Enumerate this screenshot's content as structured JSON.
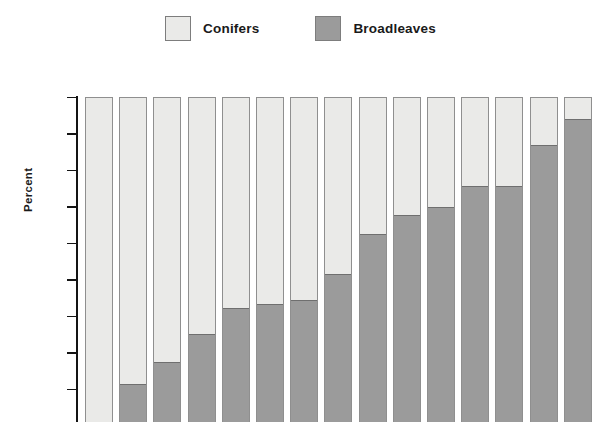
{
  "legend": {
    "position": "top-center",
    "entries": [
      {
        "label": "Conifers",
        "color": "#eaeae8",
        "icon": "legend-swatch-icon"
      },
      {
        "label": "Broadleaves",
        "color": "#9b9b9b",
        "icon": "legend-swatch-icon"
      }
    ]
  },
  "axis": {
    "ylabel": "Percent",
    "yticks": [
      100,
      90,
      80,
      70,
      60,
      50,
      40,
      30,
      20,
      10
    ],
    "ytick_labels": [
      "100",
      "90",
      "80",
      "70",
      "60",
      "50",
      "40",
      "30",
      "20",
      "10"
    ]
  },
  "chart_data": {
    "type": "bar",
    "title": "",
    "subtitle": "",
    "xlabel": "",
    "ylabel": "Percent",
    "ylim": [
      0,
      100
    ],
    "yticks": [
      10,
      20,
      30,
      40,
      50,
      60,
      70,
      80,
      90,
      100
    ],
    "grid": false,
    "stacked": true,
    "stack_total": 100,
    "legend_position": "top-center",
    "categories": [
      "1",
      "2",
      "3",
      "4",
      "5",
      "6",
      "7",
      "8",
      "9",
      "10",
      "11",
      "12",
      "13",
      "14",
      "15"
    ],
    "series": [
      {
        "name": "Broadleaves",
        "color": "#9b9b9b",
        "values": [
          0,
          10.4,
          16.3,
          24.1,
          31.3,
          32.4,
          33.3,
          40.6,
          51.5,
          56.6,
          58.7,
          64.5,
          64.6,
          75.8,
          82.8
        ]
      },
      {
        "name": "Conifers",
        "color": "#eaeae8",
        "values": [
          100,
          89.6,
          83.7,
          75.9,
          68.7,
          67.6,
          66.7,
          59.4,
          48.5,
          43.4,
          41.3,
          35.5,
          35.4,
          24.2,
          17.2
        ]
      }
    ],
    "annotations": []
  }
}
